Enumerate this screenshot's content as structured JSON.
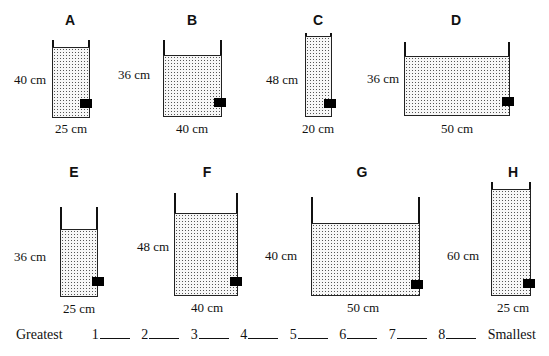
{
  "containers": [
    {
      "label": "A",
      "height": "40 cm",
      "width": "25 cm"
    },
    {
      "label": "B",
      "height": "36 cm",
      "width": "40 cm"
    },
    {
      "label": "C",
      "height": "48 cm",
      "width": "20 cm"
    },
    {
      "label": "D",
      "height": "36 cm",
      "width": "50 cm"
    },
    {
      "label": "E",
      "height": "36 cm",
      "width": "25 cm"
    },
    {
      "label": "F",
      "height": "48 cm",
      "width": "40 cm"
    },
    {
      "label": "G",
      "height": "40 cm",
      "width": "50 cm"
    },
    {
      "label": "H",
      "height": "60 cm",
      "width": "25 cm"
    }
  ],
  "answer_line": {
    "start_label": "Greatest",
    "end_label": "Smallest",
    "slots": [
      "1",
      "2",
      "3",
      "4",
      "5",
      "6",
      "7",
      "8"
    ]
  },
  "colors": {
    "ink": "#111111",
    "water_dots": "#555555",
    "background": "#ffffff"
  }
}
